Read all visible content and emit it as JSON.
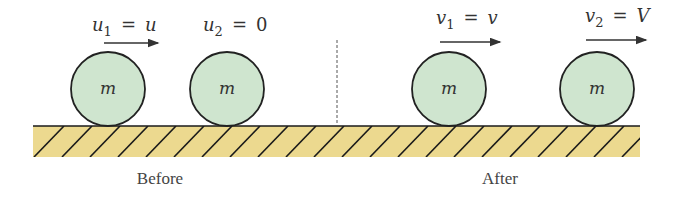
{
  "colors": {
    "ball_fill": "#cfe5cf",
    "ball_stroke": "#222222",
    "ground_fill": "#ecd98f",
    "hatch": "#1a1a1a",
    "divider": "#555555"
  },
  "before": {
    "caption": "Before",
    "ball1": {
      "mass": "m",
      "label_var": "u",
      "label_sub": "1",
      "label_eq": "=",
      "label_val": "u"
    },
    "ball2": {
      "mass": "m",
      "label_var": "u",
      "label_sub": "2",
      "label_eq": "=",
      "label_val": "0"
    }
  },
  "after": {
    "caption": "After",
    "ball1": {
      "mass": "m",
      "label_var": "v",
      "label_sub": "1",
      "label_eq": "=",
      "label_val": "v"
    },
    "ball2": {
      "mass": "m",
      "label_var": "v",
      "label_sub": "2",
      "label_eq": "=",
      "label_val": "V"
    }
  }
}
